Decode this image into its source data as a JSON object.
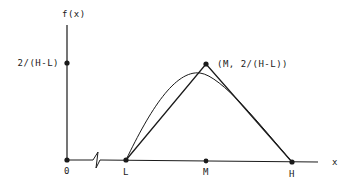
{
  "diagram": {
    "type": "triangular-distribution-pdf",
    "y_axis": {
      "label": "f(x)",
      "tick_label": "2/(H-L)"
    },
    "x_axis": {
      "label": "x",
      "origin_label": "0",
      "points": [
        "L",
        "M",
        "H"
      ]
    },
    "peak": {
      "label": "(M, 2/(H-L))"
    },
    "has_axis_break": true,
    "curves": [
      "triangle",
      "smooth-approximation"
    ],
    "colors": {
      "stroke": "#1a1a1a",
      "background": "#ffffff"
    }
  }
}
